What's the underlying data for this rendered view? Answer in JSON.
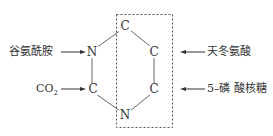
{
  "diagram": {
    "atoms": {
      "c_top": "C",
      "n_left": "N",
      "c_right_upper": "C",
      "c_left_lower": "C",
      "c_right_lower": "C",
      "n_bottom": "N"
    },
    "sources": {
      "glutamine": "谷氨酰胺",
      "co2": "CO",
      "co2_sub": "2",
      "aspartate": "天冬氨酸",
      "ribose_5_phosphate": "5–磷 酸核糖"
    }
  }
}
